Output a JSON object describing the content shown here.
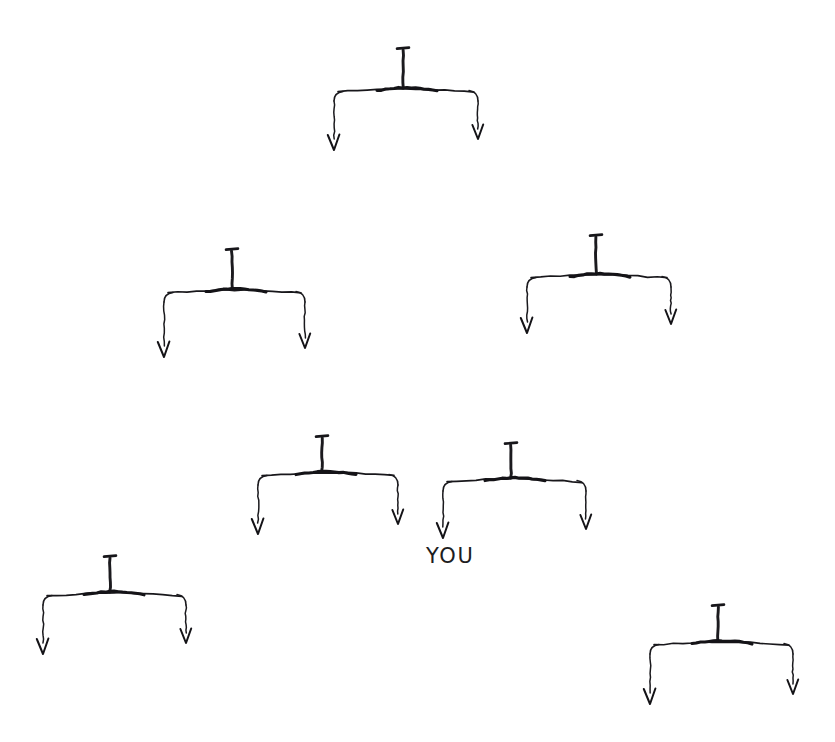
{
  "page": {
    "background_color": "#ffffff",
    "ink_color": "#17161a",
    "width": 835,
    "height": 742,
    "medium": "hand-drawn pen sketch"
  },
  "labels": [
    {
      "id": "you",
      "text": "YOU",
      "x": 426,
      "y": 544,
      "font_size": 21,
      "color": "#1d1c21",
      "attached_to": "fork-center-right-left-arrow"
    }
  ],
  "forks": [
    {
      "id": "fork-top",
      "name": "fork-top",
      "cap_x": 403,
      "cap_y": 48,
      "cap_half_width": 6,
      "stem_top_y": 50,
      "stem_bottom_y": 88,
      "bar_y": 92,
      "bar_left_x": 334,
      "bar_right_x": 478,
      "left_arm_x": 334,
      "left_arm_bottom_y": 150,
      "right_arm_x": 478,
      "right_arm_bottom_y": 139
    },
    {
      "id": "fork-mid-left",
      "name": "fork-middle-left",
      "cap_x": 232,
      "cap_y": 249,
      "cap_half_width": 6,
      "stem_top_y": 251,
      "stem_bottom_y": 289,
      "bar_y": 293,
      "bar_left_x": 164,
      "bar_right_x": 305,
      "left_arm_x": 164,
      "left_arm_bottom_y": 357,
      "right_arm_x": 305,
      "right_arm_bottom_y": 348
    },
    {
      "id": "fork-mid-right",
      "name": "fork-middle-right",
      "cap_x": 596,
      "cap_y": 235,
      "cap_half_width": 6,
      "stem_top_y": 237,
      "stem_bottom_y": 274,
      "bar_y": 278,
      "bar_left_x": 527,
      "bar_right_x": 671,
      "left_arm_x": 527,
      "left_arm_bottom_y": 333,
      "right_arm_x": 671,
      "right_arm_bottom_y": 324
    },
    {
      "id": "fork-center-left",
      "name": "fork-center-left",
      "cap_x": 322,
      "cap_y": 436,
      "cap_half_width": 6,
      "stem_top_y": 438,
      "stem_bottom_y": 472,
      "bar_y": 476,
      "bar_left_x": 258,
      "bar_right_x": 398,
      "left_arm_x": 258,
      "left_arm_bottom_y": 534,
      "right_arm_x": 398,
      "right_arm_bottom_y": 524
    },
    {
      "id": "fork-center-right",
      "name": "fork-center-right",
      "cap_x": 511,
      "cap_y": 443,
      "cap_half_width": 6,
      "stem_top_y": 445,
      "stem_bottom_y": 478,
      "bar_y": 482,
      "bar_left_x": 443,
      "bar_right_x": 586,
      "left_arm_x": 443,
      "left_arm_bottom_y": 538,
      "right_arm_x": 586,
      "right_arm_bottom_y": 529
    },
    {
      "id": "fork-bottom-left",
      "name": "fork-bottom-left",
      "cap_x": 110,
      "cap_y": 556,
      "cap_half_width": 6,
      "stem_top_y": 558,
      "stem_bottom_y": 592,
      "bar_y": 596,
      "bar_left_x": 43,
      "bar_right_x": 186,
      "left_arm_x": 43,
      "left_arm_bottom_y": 654,
      "right_arm_x": 186,
      "right_arm_bottom_y": 643
    },
    {
      "id": "fork-bottom-right",
      "name": "fork-bottom-right",
      "cap_x": 718,
      "cap_y": 605,
      "cap_half_width": 6,
      "stem_top_y": 607,
      "stem_bottom_y": 641,
      "bar_y": 645,
      "bar_left_x": 650,
      "bar_right_x": 793,
      "left_arm_x": 650,
      "left_arm_bottom_y": 704,
      "right_arm_x": 793,
      "right_arm_bottom_y": 694
    }
  ]
}
